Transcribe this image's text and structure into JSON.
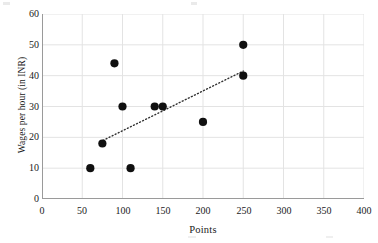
{
  "chart_data": {
    "type": "scatter",
    "title": "",
    "xlabel": "Points",
    "ylabel": "Wages per hour (in INR)",
    "xlim": [
      0,
      400
    ],
    "ylim": [
      0,
      60
    ],
    "xticks": [
      0,
      50,
      100,
      150,
      200,
      250,
      300,
      350,
      400
    ],
    "yticks": [
      0,
      10,
      20,
      30,
      40,
      50,
      60
    ],
    "xtick_labels": [
      "0",
      "50",
      "100",
      "150",
      "200",
      "250",
      "300",
      "350",
      "400"
    ],
    "ytick_labels": [
      "0",
      "10",
      "20",
      "30",
      "40",
      "50",
      "60"
    ],
    "grid": true,
    "grid_color": "#e3e3e3",
    "legend": "none",
    "marker_color": "#101010",
    "marker_shape": "circle",
    "marker_size": 7,
    "points": [
      {
        "x": 60,
        "y": 10
      },
      {
        "x": 75,
        "y": 18
      },
      {
        "x": 90,
        "y": 44
      },
      {
        "x": 100,
        "y": 30
      },
      {
        "x": 110,
        "y": 10
      },
      {
        "x": 140,
        "y": 30
      },
      {
        "x": 150,
        "y": 30
      },
      {
        "x": 200,
        "y": 25
      },
      {
        "x": 250,
        "y": 50
      },
      {
        "x": 250,
        "y": 40
      }
    ],
    "trendline": {
      "style": "dotted",
      "color": "#303030",
      "x_start": 72,
      "y_start": 18.5,
      "x_end": 250,
      "y_end": 41.5
    }
  }
}
